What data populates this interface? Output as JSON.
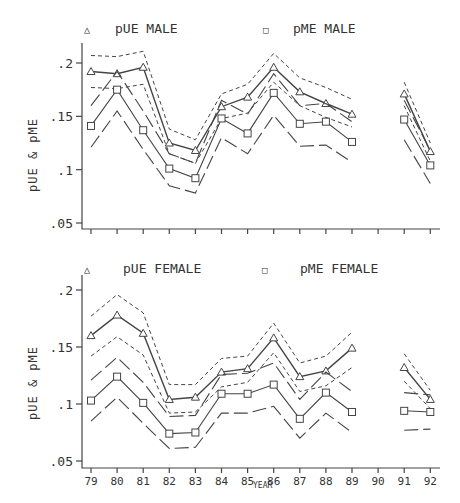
{
  "chart_data": [
    {
      "type": "line",
      "title": "",
      "panel": "male",
      "xlabel": "",
      "ylabel": "pUE & pME",
      "ylim": [
        0.05,
        0.21
      ],
      "yticks": [
        ".05",
        ".1",
        ".15",
        ".2"
      ],
      "ytick_values": [
        0.05,
        0.1,
        0.15,
        0.2
      ],
      "x": [
        79,
        80,
        81,
        82,
        83,
        84,
        85,
        86,
        87,
        88,
        89,
        90,
        91,
        92
      ],
      "grid": false,
      "legend_position": "top",
      "series": [
        {
          "name": "pUE MALE",
          "marker": "triangle",
          "values": [
            0.192,
            0.19,
            0.196,
            0.125,
            0.118,
            0.159,
            0.168,
            0.196,
            0.173,
            0.162,
            0.152,
            null,
            0.171,
            0.117
          ],
          "upper": [
            0.207,
            0.206,
            0.211,
            0.138,
            0.128,
            0.171,
            0.18,
            0.209,
            0.186,
            0.177,
            0.166,
            null,
            0.182,
            0.125
          ],
          "lower": [
            0.177,
            0.176,
            0.18,
            0.115,
            0.106,
            0.148,
            0.153,
            0.182,
            0.16,
            0.149,
            0.14,
            null,
            0.16,
            0.108
          ],
          "band_style": "short-dash"
        },
        {
          "name": "pME MALE",
          "marker": "square",
          "values": [
            0.141,
            0.175,
            0.137,
            0.101,
            0.092,
            0.148,
            0.134,
            0.172,
            0.143,
            0.145,
            0.126,
            null,
            0.147,
            0.104
          ],
          "upper": [
            0.16,
            0.192,
            0.155,
            0.115,
            0.106,
            0.165,
            0.152,
            0.19,
            0.16,
            0.162,
            0.145,
            null,
            0.165,
            0.118
          ],
          "lower": [
            0.121,
            0.155,
            0.119,
            0.085,
            0.078,
            0.13,
            0.115,
            0.151,
            0.122,
            0.123,
            0.107,
            null,
            0.128,
            0.087
          ],
          "band_style": "long-dash"
        }
      ]
    },
    {
      "type": "line",
      "title": "",
      "panel": "female",
      "xlabel": "YEAR",
      "ylabel": "pUE & pME",
      "ylim": [
        0.05,
        0.21
      ],
      "yticks": [
        ".05",
        ".1",
        ".15",
        ".2"
      ],
      "ytick_values": [
        0.05,
        0.1,
        0.15,
        0.2
      ],
      "x": [
        79,
        80,
        81,
        82,
        83,
        84,
        85,
        86,
        87,
        88,
        89,
        90,
        91,
        92
      ],
      "xticklabels": [
        "79",
        "80",
        "81",
        "82",
        "83",
        "84",
        "85",
        "86",
        "87",
        "88",
        "89",
        "90",
        "91",
        "92"
      ],
      "grid": false,
      "legend_position": "top",
      "series": [
        {
          "name": "pUE FEMALE",
          "marker": "triangle",
          "values": [
            0.16,
            0.178,
            0.162,
            0.104,
            0.106,
            0.128,
            0.131,
            0.158,
            0.124,
            0.129,
            0.149,
            null,
            0.132,
            0.104
          ],
          "upper": [
            0.177,
            0.196,
            0.18,
            0.117,
            0.117,
            0.14,
            0.142,
            0.171,
            0.136,
            0.142,
            0.163,
            null,
            0.144,
            0.112
          ],
          "lower": [
            0.142,
            0.159,
            0.143,
            0.092,
            0.093,
            0.115,
            0.119,
            0.145,
            0.111,
            0.116,
            0.132,
            null,
            0.12,
            0.096
          ],
          "band_style": "short-dash"
        },
        {
          "name": "pME FEMALE",
          "marker": "square",
          "values": [
            0.103,
            0.124,
            0.101,
            0.074,
            0.075,
            0.109,
            0.109,
            0.117,
            0.087,
            0.11,
            0.093,
            null,
            0.094,
            0.093
          ],
          "upper": [
            0.121,
            0.141,
            0.119,
            0.089,
            0.09,
            0.126,
            0.127,
            0.136,
            0.104,
            0.128,
            0.111,
            null,
            0.11,
            0.108
          ],
          "lower": [
            0.085,
            0.106,
            0.083,
            0.061,
            0.062,
            0.092,
            0.092,
            0.098,
            0.07,
            0.092,
            0.075,
            null,
            0.077,
            0.078
          ],
          "band_style": "long-dash"
        }
      ]
    }
  ],
  "legend": {
    "top": {
      "left": "pUE MALE",
      "right": "pME MALE"
    },
    "bottom": {
      "left": "pUE FEMALE",
      "right": "pME FEMALE"
    }
  },
  "axes": {
    "ylabel": "pUE & pME",
    "xlabel": "YEAR",
    "ytick_labels": [
      ".2",
      ".15",
      ".1",
      ".05"
    ],
    "xtick_labels": [
      "79",
      "80",
      "81",
      "82",
      "83",
      "84",
      "85",
      "86",
      "87",
      "88",
      "89",
      "90",
      "91",
      "92"
    ]
  },
  "colors": {
    "ink": "#444444",
    "background": "#ffffff"
  }
}
